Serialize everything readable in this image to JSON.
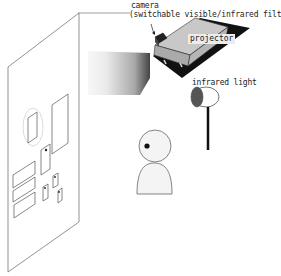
{
  "labels": {
    "camera": "camera",
    "camera_note": "(switchable visible/infrared filter)",
    "projector": "projector",
    "infrared_light": "infrared light"
  },
  "colors": {
    "line": "#555555",
    "projector_body": "#bdbdbd",
    "projector_shadow": "#111111",
    "ir_lens": "#555555",
    "person_fill": "#f4f4f4",
    "background": "#ffffff"
  }
}
